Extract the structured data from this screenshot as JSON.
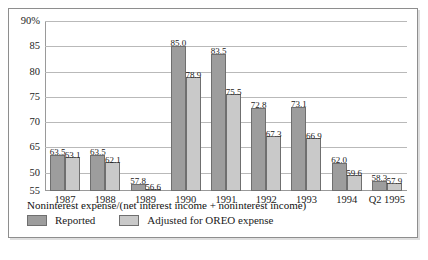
{
  "chart_data": {
    "type": "bar",
    "title": "",
    "subtitle": "",
    "caption": "Noninterest expense/(net interest income + noninterest income)",
    "xlabel": "",
    "ylabel": "",
    "categories": [
      "1987",
      "1988",
      "1989",
      "1990",
      "1991",
      "1992",
      "1993",
      "1994",
      "Q2 1995"
    ],
    "series": [
      {
        "name": "Reported",
        "color": "#9d9d9d",
        "values": [
          63.5,
          63.5,
          57.8,
          85.0,
          83.5,
          72.8,
          73.1,
          62.0,
          58.3
        ],
        "labels": [
          "63.5",
          "63.5",
          "57.8",
          "85.0",
          "83.5",
          "72.8",
          "73.1",
          "62.0",
          "58.3"
        ]
      },
      {
        "name": "Adjusted for OREO expense",
        "color": "#c9c9c9",
        "values": [
          63.1,
          62.1,
          56.6,
          78.9,
          75.5,
          67.3,
          66.9,
          59.6,
          57.9
        ],
        "labels": [
          "63.1",
          "62.1",
          "56.6",
          "78.9",
          "75.5",
          "67.3",
          "66.9",
          "59.6",
          "57.9"
        ]
      }
    ],
    "yticks": [
      {
        "label": "90%",
        "value": 90
      },
      {
        "label": "85",
        "value": 85
      },
      {
        "label": "80",
        "value": 80
      },
      {
        "label": "75",
        "value": 75
      },
      {
        "label": "70",
        "value": 70
      },
      {
        "label": "65",
        "value": 65
      },
      {
        "label": "50",
        "value": 60
      },
      {
        "label": "55",
        "value": 56.4
      }
    ],
    "ylim": [
      56.4,
      90
    ],
    "grid": true,
    "legend_position": "bottom-left",
    "legend": [
      "Reported",
      "Adjusted for OREO expense"
    ]
  }
}
